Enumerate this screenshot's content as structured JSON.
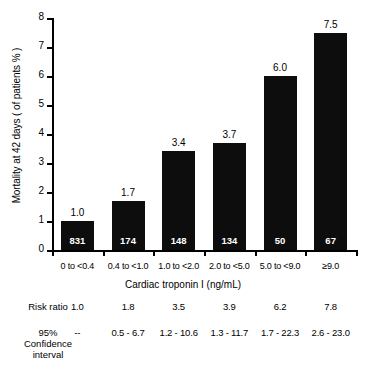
{
  "chart_data": {
    "type": "bar",
    "title": "",
    "xlabel": "Cardiac troponin I (ng/mL)",
    "ylabel": "Mortality at 42 days ( of patients % )",
    "ylim": [
      0,
      8
    ],
    "yticks": [
      "0",
      "1",
      "2",
      "3",
      "4",
      "5",
      "6",
      "7",
      "8"
    ],
    "grid": false,
    "legend": "none",
    "categories": [
      "0 to <0.4",
      "0.4 to <1.0",
      "1.0 to <2.0",
      "2.0 to <5.0",
      "5.0 to <9.0",
      "≥9.0"
    ],
    "values": [
      1.0,
      1.7,
      3.4,
      3.7,
      6.0,
      7.5
    ],
    "value_labels": [
      "1.0",
      "1.7",
      "3.4",
      "3.7",
      "6.0",
      "7.5"
    ],
    "bar_counts": [
      "831",
      "174",
      "148",
      "134",
      "50",
      "67"
    ],
    "annotations": {
      "risk_ratio_label": "Risk ratio",
      "risk_ratio": [
        "1.0",
        "1.8",
        "3.5",
        "3.9",
        "6.2",
        "7.8"
      ],
      "ci_label_lines": [
        "95%",
        "Confidence",
        "interval"
      ],
      "ci": [
        "--",
        "0.5 - 6.7",
        "1.2 - 10.6",
        "1.3 - 11.7",
        "1.7 - 22.3",
        "2.6 - 23.0"
      ]
    },
    "colors": {
      "bar": "#0d0d0d",
      "axis": "#000000",
      "background": "#ffffff",
      "bar_count_text": "#ffffff"
    }
  }
}
